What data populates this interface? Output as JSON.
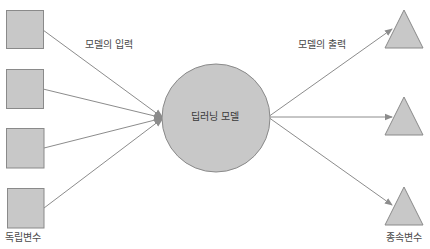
{
  "diagram": {
    "model": {
      "label": "딥러닝 모델",
      "shape": "circle",
      "cx": 216,
      "cy": 118,
      "r": 54
    },
    "input_edge_label": "모델의 입력",
    "output_edge_label": "모델의 출력",
    "inputs": {
      "label": "독립변수",
      "shape": "square",
      "count": 4
    },
    "outputs": {
      "label": "종속변수",
      "shape": "triangle",
      "count": 3
    },
    "colors": {
      "shape_fill": "#c8c8c8",
      "shape_stroke": "#8a8a8a",
      "line": "#8c8c8c",
      "text": "#4a4a4a",
      "background": "#ffffff"
    }
  }
}
